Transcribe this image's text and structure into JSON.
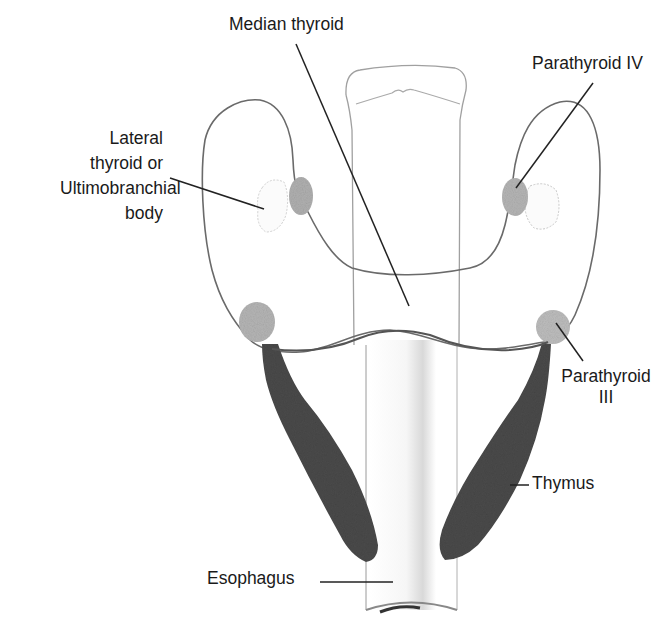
{
  "diagram": {
    "labels": {
      "median_thyroid": "Median thyroid",
      "parathyroid_iv": "Parathyroid IV",
      "lateral_thyroid_line1": "Lateral",
      "lateral_thyroid_line2": "thyroid or",
      "lateral_thyroid_line3": "Ultimobranchial",
      "lateral_thyroid_line4": "body",
      "parathyroid_iii_line1": "Parathyroid",
      "parathyroid_iii_line2": "III",
      "thymus": "Thymus",
      "esophagus": "Esophagus"
    },
    "colors": {
      "outline": "#666666",
      "leader": "#222222",
      "thymus": "#4a4a4a",
      "parathyroid": "#b5b5b5",
      "background": "#ffffff"
    }
  }
}
